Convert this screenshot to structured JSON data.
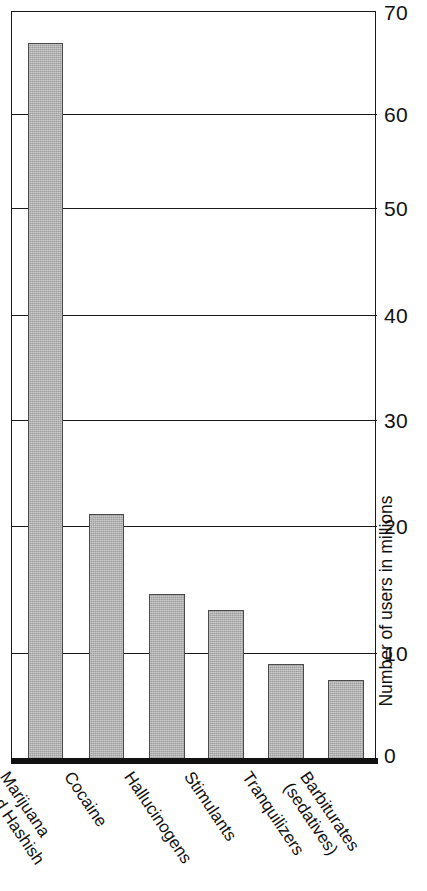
{
  "chart_data": {
    "type": "bar",
    "title": "",
    "subtitle": "",
    "xlabel": "",
    "ylabel": "Number of users in millions",
    "ylim": [
      0,
      70
    ],
    "yticks": [
      0,
      10,
      20,
      30,
      40,
      50,
      60,
      70
    ],
    "ytick_labels": [
      "0",
      "10",
      "20",
      "30",
      "40",
      "50",
      "60",
      "70"
    ],
    "grid": true,
    "grid_axis": "y",
    "legend": null,
    "legend_position": "none",
    "bar_color": "#9d9d9d",
    "bar_edge_color": "#4a4a4a",
    "axis_color": "#1a1a1a",
    "categories": [
      "Marijuana and Hashish",
      "Cocaine",
      "Hallucinogens",
      "Stimulants",
      "Tranquilizers",
      "Barbiturates (sedatives)"
    ],
    "category_lines": [
      [
        "Marijuana",
        "and Hashish"
      ],
      [
        "Cocaine"
      ],
      [
        "Hallucinogens"
      ],
      [
        "Stimulants"
      ],
      [
        "Tranquilizers"
      ],
      [
        "Barbiturates",
        "(sedatives)"
      ]
    ],
    "values": [
      67,
      23,
      15.5,
      14,
      9,
      7.5
    ],
    "units": "millions of users"
  },
  "axis": {
    "y_title": "Number of users in millions",
    "ticks": [
      "70",
      "60",
      "50",
      "40",
      "30",
      "20",
      "10",
      "0"
    ]
  },
  "bars": [
    {
      "label": "Marijuana and Hashish",
      "line1": "Marijuana",
      "line2": "and Hashish",
      "value": 67
    },
    {
      "label": "Cocaine",
      "line1": "Cocaine",
      "line2": "",
      "value": 23
    },
    {
      "label": "Hallucinogens",
      "line1": "Hallucinogens",
      "line2": "",
      "value": 15.5
    },
    {
      "label": "Stimulants",
      "line1": "Stimulants",
      "line2": "",
      "value": 14
    },
    {
      "label": "Tranquilizers",
      "line1": "Tranquilizers",
      "line2": "",
      "value": 9
    },
    {
      "label": "Barbiturates (sedatives)",
      "line1": "Barbiturates",
      "line2": "(sedatives)",
      "value": 7.5
    }
  ]
}
